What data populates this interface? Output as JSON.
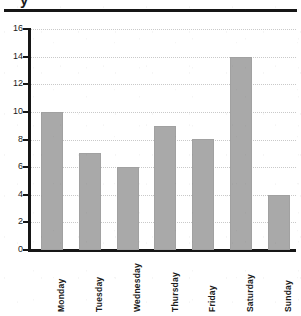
{
  "figure": {
    "clipped_header_fragment": "y",
    "rule_color": "#161616",
    "axis_color": "#161616",
    "bar_color": "#a9a9a9",
    "gridline_color": "#c9c9c9",
    "background": "#ffffff"
  },
  "chart_data": {
    "type": "bar",
    "title": "",
    "subtitle": "",
    "xlabel": "",
    "ylabel": "",
    "categories": [
      "Monday",
      "Tuesday",
      "Wednesday",
      "Thursday",
      "Friday",
      "Saturday",
      "Sunday"
    ],
    "values": [
      10,
      7,
      6,
      9,
      8,
      14,
      4
    ],
    "series": [
      {
        "name": "",
        "values": [
          10,
          7,
          6,
          9,
          8,
          14,
          4
        ]
      }
    ],
    "ylim": [
      0,
      16
    ],
    "ytick_labels": [
      "0",
      "2",
      "4",
      "6",
      "8",
      "10",
      "12",
      "14",
      "16"
    ],
    "ytick_values": [
      0,
      2,
      4,
      6,
      8,
      10,
      12,
      14,
      16
    ],
    "xtick_labels": [
      "Monday",
      "Tuesday",
      "Wednesday",
      "Thursday",
      "Friday",
      "Saturday",
      "Sunday"
    ],
    "xtick_rotation": 90,
    "grid": true,
    "grid_axis": "y",
    "grid_style": "dotted",
    "legend": false,
    "legend_position": "none",
    "annotations": []
  }
}
